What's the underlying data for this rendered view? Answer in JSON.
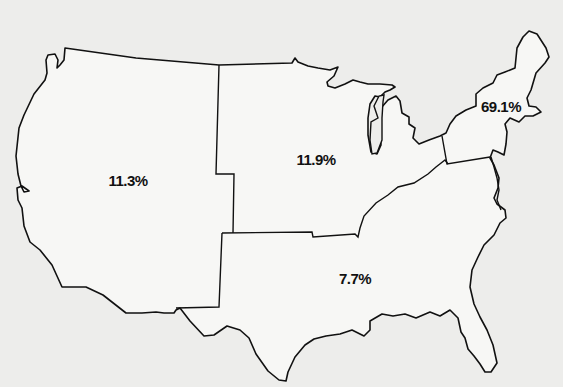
{
  "map": {
    "subject": "Contiguous United States divided into four regions",
    "regions": [
      {
        "id": "west",
        "name": "West",
        "value": "11.3%",
        "label_pos": [
          128,
          180
        ]
      },
      {
        "id": "midwest",
        "name": "Midwest",
        "value": "11.9%",
        "label_pos": [
          316,
          159
        ]
      },
      {
        "id": "south",
        "name": "South",
        "value": "7.7%",
        "label_pos": [
          355,
          278
        ]
      },
      {
        "id": "northeast",
        "name": "Northeast",
        "value": "69.1%",
        "label_pos": [
          501,
          106
        ]
      }
    ]
  },
  "colors": {
    "background": "#ededeb",
    "land": "#f7f7f5",
    "stroke": "#111111"
  }
}
